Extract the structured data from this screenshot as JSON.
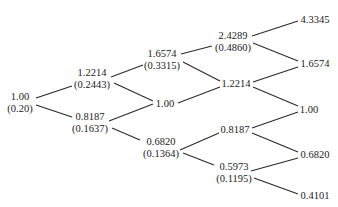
{
  "diagram": {
    "type": "binomial-tree",
    "nodes": [
      {
        "id": "n0_0",
        "value": "1.00",
        "prob": "(0.20)",
        "x": 20,
        "y": 102
      },
      {
        "id": "n1_0",
        "value": "1.2214",
        "prob": "(0.2443)",
        "x": 92,
        "y": 78
      },
      {
        "id": "n1_1",
        "value": "0.8187",
        "prob": "(0.1637)",
        "x": 90,
        "y": 122
      },
      {
        "id": "n2_0",
        "value": "1.6574",
        "prob": "(0.3315)",
        "x": 162,
        "y": 59
      },
      {
        "id": "n2_1",
        "value": "1.00",
        "prob": "",
        "x": 165,
        "y": 104
      },
      {
        "id": "n2_2",
        "value": "0.6820",
        "prob": "(0.1364)",
        "x": 161,
        "y": 147
      },
      {
        "id": "n3_0",
        "value": "2.4289",
        "prob": "(0.4860)",
        "x": 233,
        "y": 41
      },
      {
        "id": "n3_1",
        "value": "1.2214",
        "prob": "",
        "x": 236,
        "y": 84
      },
      {
        "id": "n3_2",
        "value": "0.8187",
        "prob": "",
        "x": 235,
        "y": 130
      },
      {
        "id": "n3_3",
        "value": "0.5973",
        "prob": "(0.1195)",
        "x": 234,
        "y": 172
      },
      {
        "id": "n4_0",
        "value": "4.3345",
        "prob": "",
        "x": 315,
        "y": 20
      },
      {
        "id": "n4_1",
        "value": "1.6574",
        "prob": "",
        "x": 315,
        "y": 64
      },
      {
        "id": "n4_2",
        "value": "1.00",
        "prob": "",
        "x": 309,
        "y": 110
      },
      {
        "id": "n4_3",
        "value": "0.6820",
        "prob": "",
        "x": 315,
        "y": 155
      },
      {
        "id": "n4_4",
        "value": "0.4101",
        "prob": "",
        "x": 315,
        "y": 196
      }
    ],
    "edges": [
      {
        "x1": 36,
        "y1": 98,
        "x2": 72,
        "y2": 86
      },
      {
        "x1": 36,
        "y1": 105,
        "x2": 72,
        "y2": 117
      },
      {
        "x1": 111,
        "y1": 77,
        "x2": 143,
        "y2": 65
      },
      {
        "x1": 114,
        "y1": 83,
        "x2": 153,
        "y2": 101
      },
      {
        "x1": 109,
        "y1": 121,
        "x2": 153,
        "y2": 104
      },
      {
        "x1": 112,
        "y1": 128,
        "x2": 140,
        "y2": 140
      },
      {
        "x1": 181,
        "y1": 54,
        "x2": 212,
        "y2": 46
      },
      {
        "x1": 183,
        "y1": 62,
        "x2": 220,
        "y2": 81
      },
      {
        "x1": 178,
        "y1": 103,
        "x2": 220,
        "y2": 87
      },
      {
        "x1": 180,
        "y1": 150,
        "x2": 219,
        "y2": 133
      },
      {
        "x1": 183,
        "y1": 153,
        "x2": 214,
        "y2": 165
      },
      {
        "x1": 252,
        "y1": 36,
        "x2": 298,
        "y2": 21
      },
      {
        "x1": 253,
        "y1": 43,
        "x2": 298,
        "y2": 61
      },
      {
        "x1": 253,
        "y1": 82,
        "x2": 298,
        "y2": 67
      },
      {
        "x1": 253,
        "y1": 87,
        "x2": 298,
        "y2": 106
      },
      {
        "x1": 252,
        "y1": 128,
        "x2": 298,
        "y2": 112
      },
      {
        "x1": 252,
        "y1": 133,
        "x2": 298,
        "y2": 152
      },
      {
        "x1": 251,
        "y1": 171,
        "x2": 298,
        "y2": 158
      },
      {
        "x1": 254,
        "y1": 178,
        "x2": 298,
        "y2": 194
      }
    ]
  }
}
